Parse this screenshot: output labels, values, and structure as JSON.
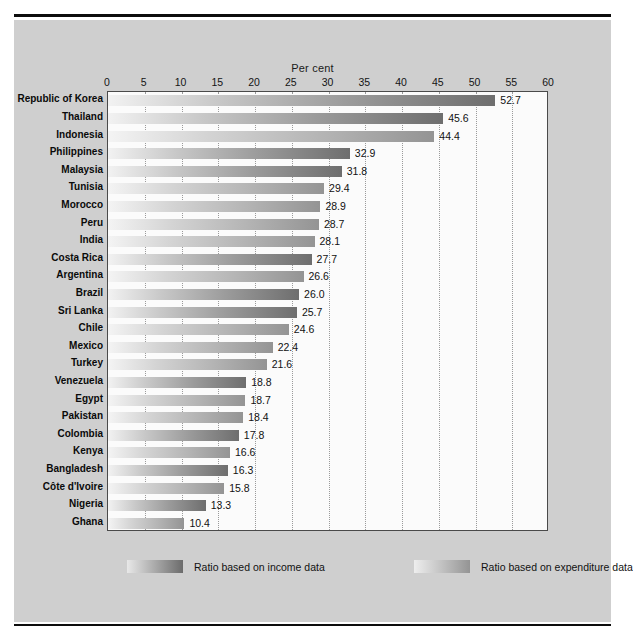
{
  "chart_data": {
    "type": "bar",
    "orientation": "horizontal",
    "title": "",
    "xlabel": "Per cent",
    "ylabel": "",
    "xlim": [
      0,
      60
    ],
    "xticks": [
      0,
      5,
      10,
      15,
      20,
      25,
      30,
      35,
      40,
      45,
      50,
      55,
      60
    ],
    "grid": true,
    "legend_position": "bottom",
    "categories": [
      "Republic of Korea",
      "Thailand",
      "Indonesia",
      "Philippines",
      "Malaysia",
      "Tunisia",
      "Morocco",
      "Peru",
      "India",
      "Costa Rica",
      "Argentina",
      "Brazil",
      "Sri Lanka",
      "Chile",
      "Mexico",
      "Turkey",
      "Venezuela",
      "Egypt",
      "Pakistan",
      "Colombia",
      "Kenya",
      "Bangladesh",
      "Côte d'Ivoire",
      "Nigeria",
      "Ghana"
    ],
    "values": [
      52.7,
      45.6,
      44.4,
      32.9,
      31.8,
      29.4,
      28.9,
      28.7,
      28.1,
      27.7,
      26.6,
      26.0,
      25.7,
      24.6,
      22.4,
      21.6,
      18.8,
      18.7,
      18.4,
      17.8,
      16.6,
      16.3,
      15.8,
      13.3,
      10.4
    ],
    "value_labels": [
      "52.7",
      "45.6",
      "44.4",
      "32.9",
      "31.8",
      "29.4",
      "28.9",
      "28.7",
      "28.1",
      "27.7",
      "26.6",
      "26.0",
      "25.7",
      "24.6",
      "22.4",
      "21.6",
      "18.8",
      "18.7",
      "18.4",
      "17.8",
      "16.6",
      "16.3",
      "15.8",
      "13.3",
      "10.4"
    ],
    "series_of_bar": [
      "income",
      "income",
      "expenditure",
      "income",
      "income",
      "expenditure",
      "expenditure",
      "expenditure",
      "expenditure",
      "income",
      "expenditure",
      "income",
      "income",
      "expenditure",
      "expenditure",
      "expenditure",
      "income",
      "expenditure",
      "expenditure",
      "income",
      "expenditure",
      "income",
      "expenditure",
      "income",
      "expenditure"
    ],
    "series": [
      {
        "name": "Ratio based on income data",
        "key": "income",
        "color": "#6e6e6e"
      },
      {
        "name": "Ratio based on expenditure data",
        "key": "expenditure",
        "color": "#949494"
      }
    ]
  },
  "axis": {
    "title": "Per cent"
  },
  "legend": {
    "items": [
      {
        "label": "Ratio based on income data",
        "key": "income"
      },
      {
        "label": "Ratio based on expenditure data",
        "key": "expenditure"
      }
    ]
  },
  "colors": {
    "panel_background": "#cfcfcf",
    "plot_background": "#fbfbfb",
    "rule": "#0d0d0d",
    "income_dark": "#6e6e6e",
    "expenditure_light": "#949494"
  }
}
